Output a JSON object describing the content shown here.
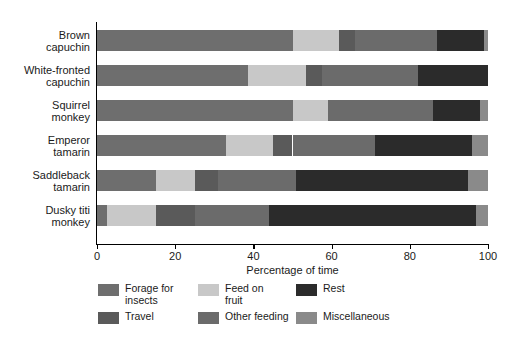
{
  "chart_data": {
    "type": "bar",
    "subtype": "horizontal-stacked-100",
    "title": "",
    "xlabel": "Percentage of time",
    "ylabel": "",
    "xlim": [
      0,
      100
    ],
    "xticks": [
      0,
      20,
      40,
      60,
      80,
      100
    ],
    "xtick_labels": [
      "0",
      "20",
      "40",
      "60",
      "80",
      "100"
    ],
    "grid": false,
    "legend_position": "bottom",
    "categories": [
      "Brown capuchin",
      "White-fronted capuchin",
      "Squirrel monkey",
      "Emperor tamarin",
      "Saddleback tamarin",
      "Dusky titi monkey"
    ],
    "category_lines": [
      [
        "Brown",
        "capuchin"
      ],
      [
        "White-fronted",
        "capuchin"
      ],
      [
        "Squirrel",
        "monkey"
      ],
      [
        "Emperor",
        "tamarin"
      ],
      [
        "Saddleback",
        "tamarin"
      ],
      [
        "Dusky titi",
        "monkey"
      ]
    ],
    "series": [
      {
        "name": "Forage for insects",
        "color": "#6e6e6e",
        "values": [
          50,
          38.5,
          50,
          33,
          15,
          2.5
        ]
      },
      {
        "name": "Feed on fruit",
        "color": "#c8c8c8",
        "values": [
          12,
          15,
          9,
          12,
          10,
          12.5
        ]
      },
      {
        "name": "Travel",
        "color": "#5a5a5a",
        "values": [
          4,
          4,
          0,
          5,
          6,
          10
        ]
      },
      {
        "name": "Other feeding",
        "color": "#6b6b6b",
        "values": [
          21,
          24.5,
          27,
          21,
          20,
          19
        ]
      },
      {
        "name": "Rest",
        "color": "#2b2b2b",
        "values": [
          12,
          18,
          12,
          25,
          44,
          53
        ]
      },
      {
        "name": "Miscellaneous",
        "color": "#8a8a8a",
        "values": [
          1,
          0,
          2,
          4,
          5,
          3
        ]
      }
    ],
    "stacks": [
      {
        "category": "Brown capuchin",
        "segments": [
          {
            "name": "Forage for insects",
            "start": 0,
            "end": 50,
            "value": 50,
            "color": "#6e6e6e"
          },
          {
            "name": "Feed on fruit",
            "start": 50,
            "end": 62,
            "value": 12,
            "color": "#c8c8c8"
          },
          {
            "name": "Travel",
            "start": 62,
            "end": 66,
            "value": 4,
            "color": "#5a5a5a"
          },
          {
            "name": "Other feeding",
            "start": 66,
            "end": 87,
            "value": 21,
            "color": "#6b6b6b"
          },
          {
            "name": "Rest",
            "start": 87,
            "end": 99,
            "value": 12,
            "color": "#2b2b2b"
          },
          {
            "name": "Miscellaneous",
            "start": 99,
            "end": 100,
            "value": 1,
            "color": "#8a8a8a"
          }
        ]
      },
      {
        "category": "White-fronted capuchin",
        "segments": [
          {
            "name": "Forage for insects",
            "start": 0,
            "end": 38.5,
            "value": 38.5,
            "color": "#6e6e6e"
          },
          {
            "name": "Feed on fruit",
            "start": 38.5,
            "end": 53.5,
            "value": 15,
            "color": "#c8c8c8"
          },
          {
            "name": "Travel",
            "start": 53.5,
            "end": 57.5,
            "value": 4,
            "color": "#5a5a5a"
          },
          {
            "name": "Other feeding",
            "start": 57.5,
            "end": 82,
            "value": 24.5,
            "color": "#6b6b6b"
          },
          {
            "name": "Rest",
            "start": 82,
            "end": 100,
            "value": 18,
            "color": "#2b2b2b"
          }
        ]
      },
      {
        "category": "Squirrel monkey",
        "segments": [
          {
            "name": "Forage for insects",
            "start": 0,
            "end": 50,
            "value": 50,
            "color": "#6e6e6e"
          },
          {
            "name": "Feed on fruit",
            "start": 50,
            "end": 59,
            "value": 9,
            "color": "#c8c8c8"
          },
          {
            "name": "Other feeding",
            "start": 59,
            "end": 86,
            "value": 27,
            "color": "#6b6b6b"
          },
          {
            "name": "Rest",
            "start": 86,
            "end": 98,
            "value": 12,
            "color": "#2b2b2b"
          },
          {
            "name": "Miscellaneous",
            "start": 98,
            "end": 100,
            "value": 2,
            "color": "#8a8a8a"
          }
        ]
      },
      {
        "category": "Emperor tamarin",
        "segments": [
          {
            "name": "Forage for insects",
            "start": 0,
            "end": 33,
            "value": 33,
            "color": "#6e6e6e"
          },
          {
            "name": "Feed on fruit",
            "start": 33,
            "end": 45,
            "value": 12,
            "color": "#c8c8c8"
          },
          {
            "name": "Travel",
            "start": 45,
            "end": 50,
            "value": 5,
            "color": "#5a5a5a"
          },
          {
            "name": "Other feeding",
            "start": 50,
            "end": 71,
            "value": 21,
            "color": "#6b6b6b"
          },
          {
            "name": "Rest",
            "start": 71,
            "end": 96,
            "value": 25,
            "color": "#2b2b2b"
          },
          {
            "name": "Miscellaneous",
            "start": 96,
            "end": 100,
            "value": 4,
            "color": "#8a8a8a"
          }
        ]
      },
      {
        "category": "Saddleback tamarin",
        "segments": [
          {
            "name": "Forage for insects",
            "start": 0,
            "end": 15,
            "value": 15,
            "color": "#6e6e6e"
          },
          {
            "name": "Feed on fruit",
            "start": 15,
            "end": 25,
            "value": 10,
            "color": "#c8c8c8"
          },
          {
            "name": "Travel",
            "start": 25,
            "end": 31,
            "value": 6,
            "color": "#5a5a5a"
          },
          {
            "name": "Other feeding",
            "start": 31,
            "end": 51,
            "value": 20,
            "color": "#6b6b6b"
          },
          {
            "name": "Rest",
            "start": 51,
            "end": 95,
            "value": 44,
            "color": "#2b2b2b"
          },
          {
            "name": "Miscellaneous",
            "start": 95,
            "end": 100,
            "value": 5,
            "color": "#8a8a8a"
          }
        ]
      },
      {
        "category": "Dusky titi monkey",
        "segments": [
          {
            "name": "Forage for insects",
            "start": 0,
            "end": 2.5,
            "value": 2.5,
            "color": "#6e6e6e"
          },
          {
            "name": "Feed on fruit",
            "start": 2.5,
            "end": 15,
            "value": 12.5,
            "color": "#c8c8c8"
          },
          {
            "name": "Travel",
            "start": 15,
            "end": 25,
            "value": 10,
            "color": "#5a5a5a"
          },
          {
            "name": "Other feeding",
            "start": 25,
            "end": 44,
            "value": 19,
            "color": "#6b6b6b"
          },
          {
            "name": "Rest",
            "start": 44,
            "end": 97,
            "value": 53,
            "color": "#2b2b2b"
          },
          {
            "name": "Miscellaneous",
            "start": 97,
            "end": 100,
            "value": 3,
            "color": "#8a8a8a"
          }
        ]
      }
    ],
    "legend": [
      {
        "label": "Forage for\ninsects",
        "color": "#6e6e6e"
      },
      {
        "label": "Feed on\nfruit",
        "color": "#c8c8c8"
      },
      {
        "label": "Rest",
        "color": "#2b2b2b"
      },
      {
        "label": "Travel",
        "color": "#5a5a5a"
      },
      {
        "label": "Other feeding",
        "color": "#6b6b6b"
      },
      {
        "label": "Miscellaneous",
        "color": "#8a8a8a"
      }
    ]
  }
}
